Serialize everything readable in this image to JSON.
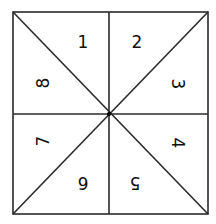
{
  "diagram": {
    "type": "square-divided-into-8-triangles",
    "stroke_color": "#2a2a2a",
    "background": "#ffffff",
    "square": {
      "x1": 13,
      "y1": 12,
      "x2": 208,
      "y2": 214
    },
    "center": {
      "x": 109,
      "y": 114
    },
    "sections": [
      {
        "label": "1",
        "x": 83,
        "y": 42,
        "rotation": 0
      },
      {
        "label": "2",
        "x": 137,
        "y": 42,
        "rotation": 0
      },
      {
        "label": "3",
        "x": 178,
        "y": 84,
        "rotation": 90
      },
      {
        "label": "4",
        "x": 178,
        "y": 143,
        "rotation": 90
      },
      {
        "label": "5",
        "x": 135,
        "y": 183,
        "rotation": 180
      },
      {
        "label": "6",
        "x": 83,
        "y": 183,
        "rotation": 180
      },
      {
        "label": "7",
        "x": 43,
        "y": 141,
        "rotation": -90
      },
      {
        "label": "8",
        "x": 43,
        "y": 83,
        "rotation": -90
      }
    ]
  }
}
